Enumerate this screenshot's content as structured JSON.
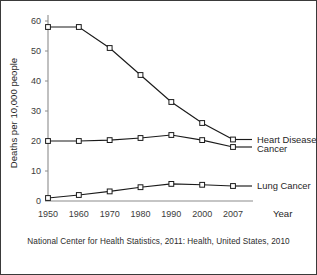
{
  "caption": "National Center for Health Statistics, 2011: Health, United States, 2010",
  "chart_data": {
    "type": "line",
    "title": "",
    "subtitle": "",
    "xlabel": "Year",
    "ylabel": "Deaths per 10,000 people",
    "categories": [
      "1950",
      "1960",
      "1970",
      "1980",
      "1990",
      "2000",
      "2007"
    ],
    "yticks": [
      0,
      10,
      20,
      30,
      40,
      50,
      60
    ],
    "xticks": [
      "1950",
      "1960",
      "1970",
      "1980",
      "1990",
      "2000",
      "2007"
    ],
    "ylim": [
      0,
      62
    ],
    "grid": false,
    "legend_position": "right-inline",
    "marker": "open-square",
    "series": [
      {
        "name": "Heart Disease",
        "values": [
          58,
          58,
          51,
          42,
          33,
          26,
          20.5
        ],
        "color": "#1a1a1a",
        "label_position": "right"
      },
      {
        "name": "Cancer",
        "values": [
          20,
          20,
          20.3,
          21,
          22,
          20.3,
          18
        ],
        "color": "#1a1a1a",
        "label_position": "right"
      },
      {
        "name": "Lung Cancer",
        "values": [
          1,
          2,
          3.2,
          4.6,
          5.7,
          5.4,
          5
        ],
        "color": "#1a1a1a",
        "label_position": "right"
      }
    ]
  }
}
